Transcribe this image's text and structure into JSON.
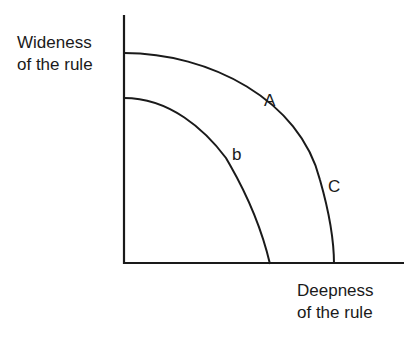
{
  "diagram": {
    "y_axis_label": [
      "Wideness",
      "of the rule"
    ],
    "x_axis_label": [
      "Deepness",
      "of the rule"
    ],
    "curves": [
      {
        "name": "outer",
        "points_labeled": [
          "A",
          "C"
        ]
      },
      {
        "name": "inner",
        "points_labeled": [
          "b"
        ]
      }
    ],
    "labels": {
      "A": "A",
      "b": "b",
      "C": "C"
    },
    "colors": {
      "line": "#1a1a1a",
      "background": "#ffffff"
    }
  }
}
